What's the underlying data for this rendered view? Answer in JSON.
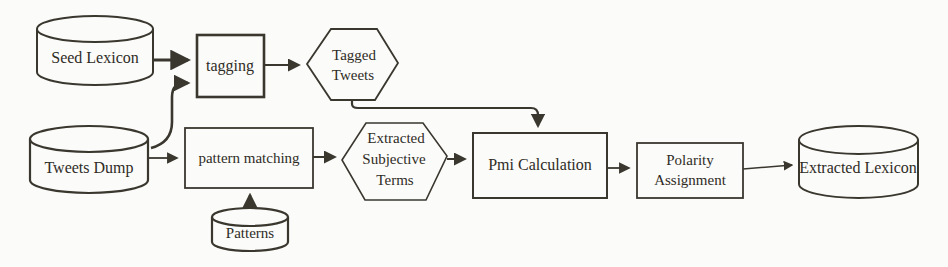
{
  "figure": {
    "colors": {
      "paper": "#fbfbf9",
      "ink": "#3a372f",
      "text": "#2f2c26"
    }
  },
  "nodes": {
    "seed_lexicon": {
      "type": "cylinder",
      "label": "Seed Lexicon"
    },
    "tagging": {
      "type": "process",
      "label": "tagging"
    },
    "tagged_tweets": {
      "type": "hexagon",
      "line1": "Tagged",
      "line2": "Tweets"
    },
    "tweets_dump": {
      "type": "cylinder",
      "label": "Tweets Dump"
    },
    "pattern_matching": {
      "type": "process",
      "label": "pattern matching"
    },
    "patterns": {
      "type": "cylinder",
      "label": "Patterns"
    },
    "extracted_subjective_terms": {
      "type": "hexagon",
      "line1": "Extracted",
      "line2": "Subjective",
      "line3": "Terms"
    },
    "pmi_calculation": {
      "type": "process",
      "label": "Pmi Calculation"
    },
    "polarity_assignment": {
      "type": "process",
      "line1": "Polarity",
      "line2": "Assignment"
    },
    "extracted_lexicon": {
      "type": "cylinder",
      "label": "Extracted Lexicon"
    }
  },
  "edges": [
    {
      "from": "seed_lexicon",
      "to": "tagging"
    },
    {
      "from": "tweets_dump",
      "to": "tagging"
    },
    {
      "from": "tagging",
      "to": "tagged_tweets"
    },
    {
      "from": "tagged_tweets",
      "to": "pmi_calculation"
    },
    {
      "from": "tweets_dump",
      "to": "pattern_matching"
    },
    {
      "from": "patterns",
      "to": "pattern_matching"
    },
    {
      "from": "pattern_matching",
      "to": "extracted_subjective_terms"
    },
    {
      "from": "extracted_subjective_terms",
      "to": "pmi_calculation"
    },
    {
      "from": "pmi_calculation",
      "to": "polarity_assignment"
    },
    {
      "from": "polarity_assignment",
      "to": "extracted_lexicon"
    }
  ]
}
